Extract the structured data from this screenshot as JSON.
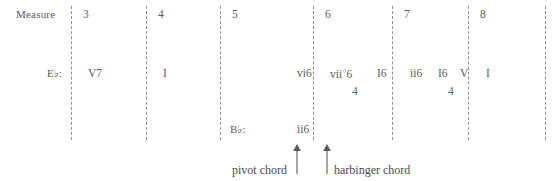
{
  "diagram": {
    "title_row_label": "Measure",
    "type": "roman-numeral-harmonic-analysis",
    "text_color": "#5a5a5a",
    "barline_color": "#8f8f8f",
    "background": "#ffffff"
  },
  "measures": [
    {
      "number": "3",
      "x": 83
    },
    {
      "number": "4",
      "x": 158
    },
    {
      "number": "5",
      "x": 232
    },
    {
      "number": "6",
      "x": 325
    },
    {
      "number": "7",
      "x": 404
    },
    {
      "number": "8",
      "x": 480
    }
  ],
  "barlines": [
    {
      "x": 71,
      "top": 6,
      "bottom": 140
    },
    {
      "x": 146,
      "top": 6,
      "bottom": 140
    },
    {
      "x": 220,
      "top": 6,
      "bottom": 140
    },
    {
      "x": 313,
      "top": 6,
      "bottom": 140
    },
    {
      "x": 392,
      "top": 6,
      "bottom": 140
    },
    {
      "x": 468,
      "top": 6,
      "bottom": 140
    },
    {
      "x": 545,
      "top": 6,
      "bottom": 140
    }
  ],
  "keys": {
    "primary": {
      "label": "E♭",
      "colon": ":",
      "x": 57,
      "y": 68
    },
    "secondary": {
      "label": "B♭",
      "colon": ":",
      "x": 240,
      "y": 124
    }
  },
  "upper_analysis": {
    "row_label": "E-flat major roman numerals",
    "chords": [
      {
        "symbol": "V7",
        "x": 88,
        "diminished": false,
        "figure_top": "",
        "figure_bottom": ""
      },
      {
        "symbol": "I",
        "x": 163,
        "diminished": false,
        "figure_top": "",
        "figure_bottom": ""
      },
      {
        "symbol": "vi6",
        "x": 297,
        "diminished": false,
        "figure_top": "",
        "figure_bottom": ""
      },
      {
        "symbol": "vii",
        "x": 330,
        "diminished": true,
        "figure_top": "6",
        "figure_bottom": "4"
      },
      {
        "symbol": "I6",
        "x": 377,
        "diminished": false,
        "figure_top": "",
        "figure_bottom": ""
      },
      {
        "symbol": "ii6",
        "x": 410,
        "diminished": false,
        "figure_top": "",
        "figure_bottom": ""
      },
      {
        "symbol": "I",
        "x": 438,
        "diminished": false,
        "figure_top": "6",
        "figure_bottom": "4"
      },
      {
        "symbol": "V",
        "x": 460,
        "diminished": false,
        "figure_top": "",
        "figure_bottom": ""
      },
      {
        "symbol": "I",
        "x": 486,
        "diminished": false,
        "figure_top": "",
        "figure_bottom": ""
      }
    ]
  },
  "lower_analysis": {
    "row_label": "B-flat major roman numerals",
    "chords": [
      {
        "symbol": "ii6",
        "x": 297
      }
    ]
  },
  "annotations": [
    {
      "label": "pivot chord",
      "text_x": 232,
      "text_y": 164,
      "arrow_x": 297,
      "arrow_y": 144
    },
    {
      "label": "harbinger chord",
      "text_x": 334,
      "text_y": 164,
      "arrow_x": 327,
      "arrow_y": 144
    }
  ]
}
